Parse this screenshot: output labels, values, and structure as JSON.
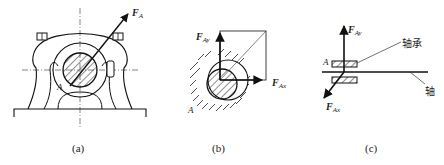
{
  "figure": {
    "panels": [
      {
        "id": "a",
        "caption": "(a)",
        "description": "Pillow-block bearing front view with shaft cross-section and resultant reaction force",
        "force_label": {
          "main": "F",
          "sub": "A"
        },
        "point_label": "A"
      },
      {
        "id": "b",
        "caption": "(b)",
        "description": "Shaft in bearing hole with reaction force decomposed into components",
        "force_labels": [
          {
            "main": "F",
            "sub": "Ay"
          },
          {
            "main": "F",
            "sub": "Ax"
          }
        ],
        "point_label": "A"
      },
      {
        "id": "c",
        "caption": "(c)",
        "description": "Simplified bearing and shaft with reaction components",
        "force_labels": [
          {
            "main": "F",
            "sub": "Ay"
          },
          {
            "main": "F",
            "sub": "Ax"
          }
        ],
        "point_label": "A",
        "callouts": {
          "bearing": "轴承",
          "shaft": "轴"
        }
      }
    ],
    "colors": {
      "stroke": "#1a1a1a",
      "background": "#ffffff"
    }
  }
}
